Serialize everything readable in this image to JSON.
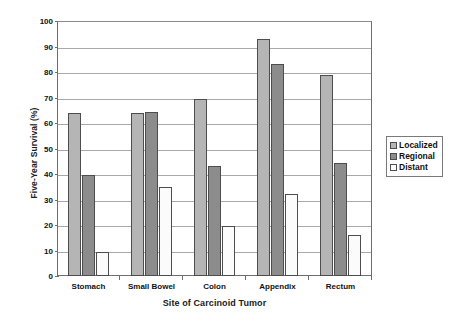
{
  "chart_data": {
    "type": "bar",
    "title": "",
    "xlabel": "Site of Carcinoid Tumor",
    "ylabel": "Five-Year Survival (%)",
    "categories": [
      "Stomach",
      "Small Bowel",
      "Colon",
      "Appendix",
      "Rectum"
    ],
    "series": [
      {
        "name": "Localized",
        "color": "#b5b5b5",
        "values": [
          64,
          64,
          69.5,
          93,
          79
        ]
      },
      {
        "name": "Regional",
        "color": "#8c8c8c",
        "values": [
          39.5,
          64.5,
          43,
          83,
          44.5
        ]
      },
      {
        "name": "Distant",
        "color": "#fbfbfb",
        "values": [
          9.5,
          35,
          19.5,
          32,
          16
        ]
      }
    ],
    "ylim": [
      0,
      100
    ],
    "yticks": [
      0,
      10,
      20,
      30,
      40,
      50,
      60,
      70,
      80,
      90,
      100
    ],
    "ytick_labels": [
      "0",
      "10",
      "20",
      "30",
      "40",
      "50",
      "60",
      "70",
      "80",
      "90",
      "100"
    ],
    "grid": true,
    "grid_axis": "y",
    "legend_position": "right",
    "legend_entries": [
      "Localized",
      "Regional",
      "Distant"
    ],
    "bar_edge_color": "#4d4d4d",
    "axis_color": "#6e6e6e",
    "gridline_color": "#a9a9a9",
    "background": "#ffffff"
  }
}
